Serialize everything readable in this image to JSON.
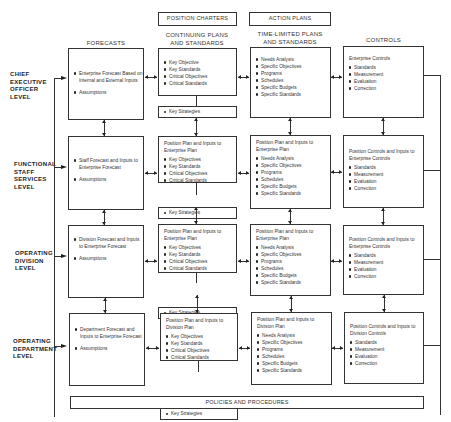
{
  "top_labels": {
    "position_charters": "POSITION CHARTERS",
    "action_plans": "ACTION PLANS"
  },
  "column_headers": {
    "forecasts": "FORECASTS",
    "continuing_line1": "CONTINUING PLANS",
    "continuing_line2": "AND STANDARDS",
    "time_limited_line1": "TIME-LIMITED PLANS",
    "time_limited_line2": "AND STANDARDS",
    "controls": "CONTROLS"
  },
  "levels": [
    {
      "lines": [
        "CHIEF",
        "EXECUTIVE",
        "OFFICER",
        "LEVEL"
      ]
    },
    {
      "lines": [
        "FUNCTIONAL",
        "STAFF",
        "SERVICES",
        "LEVEL"
      ]
    },
    {
      "lines": [
        "OPERATING",
        "DIVISION",
        "LEVEL"
      ]
    },
    {
      "lines": [
        "OPERATING",
        "DEPARTMENT",
        "LEVEL"
      ]
    }
  ],
  "rows": [
    {
      "forecast": {
        "items": [
          "Enterprise Forecast Based on Internal and External Inputs",
          "Assumptions"
        ]
      },
      "continuing": {
        "lead": "",
        "items": [
          "Key Objective",
          "Key Standards",
          "Critical Objectives",
          "Critical Standards"
        ]
      },
      "key_strategies": "Key Strategies",
      "time_limited": {
        "lead": "",
        "items": [
          "Needs Analysis",
          "Specific Objectives",
          "Programs",
          "Schedules",
          "Specific Budgets",
          "Specific Standards"
        ]
      },
      "controls": {
        "lead": "Enterprise Controls",
        "items": [
          "Standards",
          "Measurement",
          "Evaluation",
          "Correction"
        ]
      }
    },
    {
      "forecast": {
        "items": [
          "Staff Forecast and Inputs to Enterprise Forecast",
          "Assumptions"
        ]
      },
      "continuing": {
        "lead": "Position Plan and Inputs to Enterprise Plan",
        "items": [
          "Key Objectives",
          "Key Standards",
          "Critical Objectives",
          "Critical Standards"
        ]
      },
      "key_strategies": "Key Strategies",
      "time_limited": {
        "lead": "Position Plan and Inputs to Enterprise Plan",
        "items": [
          "Needs Analysis",
          "Specific Objectives",
          "Programs",
          "Schedules",
          "Specific Budgets",
          "Specific Standards"
        ]
      },
      "controls": {
        "lead": "Position Controls and Inputs to Enterprise Controls",
        "items": [
          "Standards",
          "Measurement",
          "Evaluation",
          "Correction"
        ]
      }
    },
    {
      "forecast": {
        "items": [
          "Division Forecast and Inputs to Enterprise Forecast",
          "Assumptions"
        ]
      },
      "continuing": {
        "lead": "Position Plan and Inputs to Enterprise Plan",
        "items": [
          "Key Objectives",
          "Key Standards",
          "Critical Objectives",
          "Critical Standards"
        ]
      },
      "key_strategies": "Key Strategies",
      "time_limited": {
        "lead": "Position Plan and Inputs to Enterprise Plan",
        "items": [
          "Needs Analysis",
          "Specific Objectives",
          "Programs",
          "Schedules",
          "Specific Budgets",
          "Specific Standards"
        ]
      },
      "controls": {
        "lead": "Position Controls and Inputs to Enterprise Controls",
        "items": [
          "Standards",
          "Measurement",
          "Evaluation",
          "Correction"
        ]
      }
    },
    {
      "forecast": {
        "items": [
          "Department Forecast and Inputs to Enterprise Forecast",
          "Assumptions"
        ]
      },
      "continuing": {
        "lead": "Position Plan and Inputs to Division Plan",
        "items": [
          "Key Objectives",
          "Key Standards",
          "Critical Objectives",
          "Critical Standards"
        ]
      },
      "key_strategies": "Key Strategies",
      "time_limited": {
        "lead": "Position Plan and Inputs to Division Plan",
        "items": [
          "Needs Analysis",
          "Specific Objectives",
          "Programs",
          "Schedules",
          "Specific Budgets",
          "Specific Standards"
        ]
      },
      "controls": {
        "lead": "Position Controls and Inputs to Division Controls",
        "items": [
          "Standards",
          "Measurement",
          "Evaluation",
          "Correction"
        ]
      }
    }
  ],
  "bottom_label": "POLICIES AND PROCEDURES"
}
